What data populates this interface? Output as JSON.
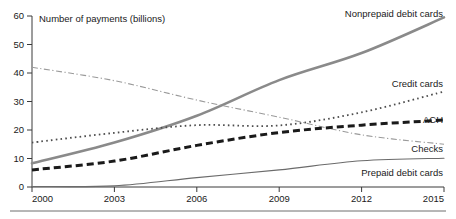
{
  "chart_data": {
    "type": "line",
    "title": "Number of payments (billions)",
    "xlabel": "",
    "ylabel": "",
    "x": [
      2000,
      2003,
      2006,
      2009,
      2012,
      2015
    ],
    "xlim": [
      2000,
      2015
    ],
    "ylim": [
      0,
      60
    ],
    "yticks": [
      0,
      10,
      20,
      30,
      40,
      50,
      60
    ],
    "xticks": [
      2000,
      2003,
      2006,
      2009,
      2012,
      2015
    ],
    "xtick_labels": [
      "2000",
      "2003",
      "2006",
      "2009",
      "2012",
      "2015"
    ],
    "ytick_labels": [
      "0",
      "10",
      "20",
      "30",
      "40",
      "50",
      "60"
    ],
    "grid": false,
    "legend_position": "inline-right",
    "series": [
      {
        "name": "Nonprepaid debit cards",
        "style": "solid-thick",
        "color": "#8a8a8a",
        "label": "Nonprepaid debit cards",
        "values": [
          8.3,
          15.6,
          25.0,
          37.5,
          47.0,
          59.5
        ]
      },
      {
        "name": "Checks",
        "style": "dash-dot",
        "color": "#9a9a9a",
        "label": "Checks",
        "values": [
          42.0,
          37.3,
          30.5,
          24.5,
          18.3,
          15.0
        ]
      },
      {
        "name": "Credit cards",
        "style": "dotted",
        "color": "#4d4d4d",
        "label": "Credit cards",
        "values": [
          15.6,
          19.0,
          21.7,
          21.6,
          26.2,
          33.5
        ]
      },
      {
        "name": "ACH",
        "style": "dashed-thick",
        "color": "#1a1a1a",
        "label": "ACH",
        "values": [
          6.0,
          9.1,
          14.6,
          19.1,
          21.7,
          23.5
        ]
      },
      {
        "name": "Prepaid debit cards",
        "style": "solid-thin",
        "color": "#6b6b6b",
        "label": "Prepaid debit cards",
        "values": [
          0.2,
          0.4,
          3.3,
          6.0,
          9.2,
          10.1
        ]
      }
    ]
  },
  "figure": {
    "axis_color": "#3a3a3a",
    "rule_color": "#6e6e6e",
    "background": "#ffffff"
  }
}
